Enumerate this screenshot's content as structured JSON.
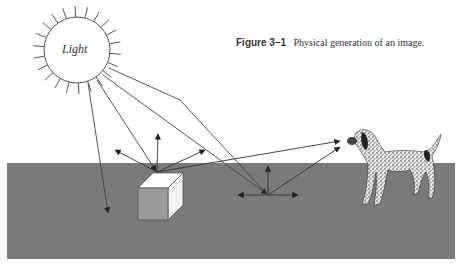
{
  "figure": {
    "number": "Figure 3–1",
    "caption": "Physical generation of an image."
  },
  "sun": {
    "label": "Light",
    "cx": 77,
    "cy": 50,
    "r": 33
  },
  "colors": {
    "ground": "#7a7a7a",
    "line": "#444444",
    "box_front": "#9a9a9a",
    "box_top": "#ffffff",
    "box_side": "#f2f2f2"
  },
  "elements": {
    "light_source": "sun",
    "reflecting_object": "cube",
    "reflecting_surface": "ground plane",
    "observer": "dog"
  }
}
